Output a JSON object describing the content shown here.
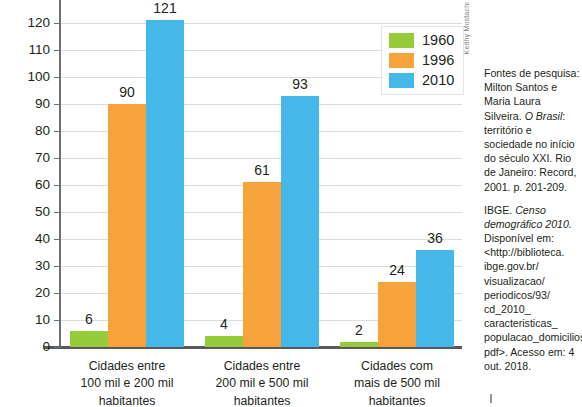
{
  "chart_data": {
    "type": "bar",
    "title": "",
    "subtitle": "",
    "xlabel": "",
    "ylabel": "",
    "ylim": [
      0,
      130
    ],
    "y_tick_step": 10,
    "grid": true,
    "legend_position": "top-right",
    "categories": [
      "Cidades entre\n100 mil e 200 mil\nhabitantes",
      "Cidades entre\n200 mil e 500 mil\nhabitantes",
      "Cidades  com\nmais de 500 mil\nhabitantes"
    ],
    "y_ticks": [
      "130",
      "120",
      "110",
      "100",
      "90",
      "80",
      "70",
      "60",
      "50",
      "40",
      "30",
      "20",
      "10",
      "0"
    ],
    "series": [
      {
        "name": "1960",
        "color": "#96cb3c",
        "values": [
          6,
          4,
          2
        ]
      },
      {
        "name": "1996",
        "color": "#f6a33c",
        "values": [
          90,
          61,
          24
        ]
      },
      {
        "name": "2010",
        "color": "#45b8e9",
        "values": [
          121,
          93,
          36
        ]
      }
    ]
  },
  "legend": {
    "items": [
      {
        "label": "1960",
        "color": "#96cb3c"
      },
      {
        "label": "1996",
        "color": "#f6a33c"
      },
      {
        "label": "2010",
        "color": "#45b8e9"
      }
    ]
  },
  "credit": {
    "text": "Keithy Mostachi"
  },
  "sources": {
    "paragraphs": [
      "Fontes de pesquisa: Milton Santos e Maria Laura Silveira. O Brasil: território e sociedade no início do século XXI. Rio de Janeiro: Record, 2001. p. 201-209.",
      "IBGE. Censo demográfico 2010. Disponível em: <http://biblioteca. ibge.gov.br/ visualizacao/ periodicos/93/ cd_2010_ caracteristicas_ populacao_domicilios. pdf>. Acesso em: 4 out. 2018."
    ],
    "p1_pre": "Fontes de pesquisa: Milton Santos e Maria Laura Silveira. ",
    "p1_italic": "O Brasil",
    "p1_post": ": território e sociedade no início do século XXI. Rio de Janeiro: Record, 2001. p. 201-209.",
    "p2_pre": "IBGE. ",
    "p2_italic": "Censo demográfico 2010.",
    "p2_post": " Disponível em: <http://biblioteca. ibge.gov.br/ visualizacao/ periodicos/93/ cd_2010_ caracteristicas_ populacao_domicilios. pdf>. Acesso em: 4 out. 2018."
  }
}
